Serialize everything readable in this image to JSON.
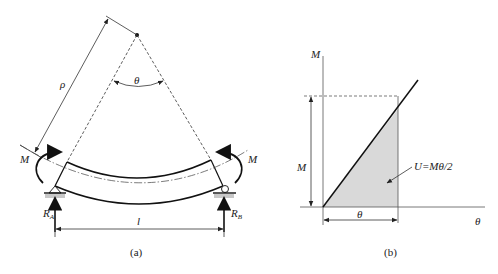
{
  "figure": {
    "panel_a": {
      "caption": "(a)",
      "labels": {
        "radius": "ρ",
        "angle": "θ",
        "moment_left": "M",
        "moment_right": "M",
        "reaction_left": "R",
        "reaction_left_sub": "A",
        "reaction_right": "R",
        "reaction_right_sub": "B",
        "span": "l"
      }
    },
    "panel_b": {
      "caption": "(b)",
      "labels": {
        "y_axis": "M",
        "x_axis": "θ",
        "moment_dim": "M",
        "angle_dim": "θ",
        "energy": "U=Mθ/2"
      },
      "fill_color": "#d9d9d9"
    }
  }
}
